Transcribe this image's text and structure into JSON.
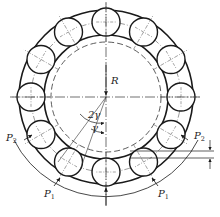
{
  "diagram": {
    "title": "",
    "type": "roller bearing load distribution",
    "center": [
      106,
      97
    ],
    "outer_ring_radius": 87,
    "inner_ring_radius": 62,
    "inner_dashed_radius": 55,
    "pitch_radius": 75,
    "roller_radius": 14,
    "roller_count": 12,
    "housing_arc_radius": 103,
    "stroke_color": "#1a1a1a"
  },
  "labels": {
    "radius": "R",
    "angle_double": "2γ",
    "angle_single": "γ",
    "load_p2_left": {
      "main": "P",
      "sub": "2"
    },
    "load_p2_right": {
      "main": "P",
      "sub": "2"
    },
    "load_p1_left": {
      "main": "P",
      "sub": "1"
    },
    "load_p1_right": {
      "main": "P",
      "sub": "1"
    }
  }
}
